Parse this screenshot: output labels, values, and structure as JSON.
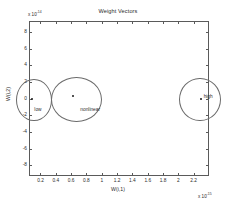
{
  "figure": {
    "title": "Weight Vectors",
    "background": "#ffffff",
    "axis_color": "#5a5a5a",
    "text_color": "#2b2b2b",
    "annotation_color": "#6b6b6b"
  },
  "axes": {
    "x_label": "W(i,1)",
    "y_label": "W(i,2)",
    "x_exponent_prefix": "x 10",
    "x_exponent_value": "-15",
    "y_exponent_prefix": "x 10",
    "y_exponent_value": "-14",
    "x_ticks": [
      "0.2",
      "0.4",
      "0.6",
      "0.8",
      "1",
      "1.2",
      "1.4",
      "1.6",
      "1.8",
      "2",
      "2.2"
    ],
    "y_ticks": [
      "8",
      "6",
      "4",
      "2",
      "0",
      "-2",
      "-4",
      "-6",
      "-8"
    ]
  },
  "annotations": {
    "low": "low",
    "medium": "nonlinear",
    "high": "high"
  },
  "chart_data": {
    "type": "scatter",
    "title": "Weight Vectors",
    "xlabel": "W(i,1)",
    "ylabel": "W(i,2)",
    "x_exponent": -15,
    "y_exponent": -14,
    "xlim": [
      0.05,
      2.4
    ],
    "ylim": [
      -9.3,
      9.3
    ],
    "xticks": [
      0.2,
      0.4,
      0.6,
      0.8,
      1.0,
      1.2,
      1.4,
      1.6,
      1.8,
      2.0,
      2.2
    ],
    "yticks": [
      8,
      6,
      4,
      2,
      0,
      -2,
      -4,
      -6,
      -8
    ],
    "grid": false,
    "legend": null,
    "series": [
      {
        "name": "weight vectors",
        "marker": "dot",
        "color": "#1a1a1a",
        "points": [
          {
            "x": 0.09,
            "y": 0.0,
            "group": "low"
          },
          {
            "x": 0.63,
            "y": 0.3,
            "group": "nonlinear"
          },
          {
            "x": 2.29,
            "y": 0.0,
            "group": "high"
          }
        ]
      }
    ],
    "annotation_ellipses": [
      {
        "label": "low",
        "cx": 0.1,
        "cy": 0.0,
        "rx": 0.22,
        "ry": 2.4,
        "label_dx": 0.02,
        "label_dy": -1.4
      },
      {
        "label": "nonlinear",
        "cx": 0.66,
        "cy": 0.0,
        "rx": 0.32,
        "ry": 2.6,
        "label_dx": 0.06,
        "label_dy": -1.4
      },
      {
        "label": "high",
        "cx": 2.27,
        "cy": 0.0,
        "rx": 0.26,
        "ry": 2.5,
        "label_dx": 0.06,
        "label_dy": 0.2
      }
    ]
  }
}
